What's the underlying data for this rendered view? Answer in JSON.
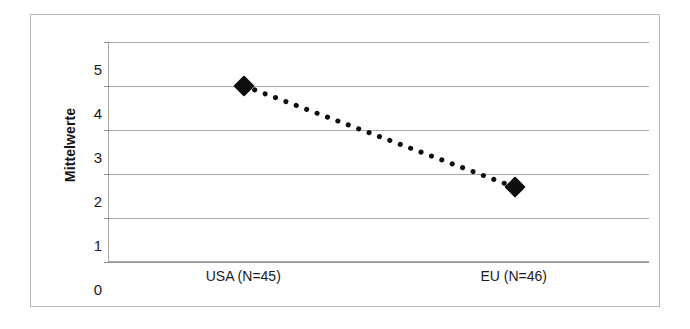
{
  "chart_data": {
    "type": "line",
    "title": "",
    "subtitle": "",
    "xlabel": "",
    "ylabel": "Mittelwerte",
    "categories": [
      "USA (N=45)",
      "EU (N=46)"
    ],
    "values": [
      4.0,
      1.7
    ],
    "series": [
      {
        "name": "Mittelwerte",
        "values": [
          4.0,
          1.7
        ],
        "marker": "diamond",
        "marker_color": "#0d0d0d",
        "line_style": "dotted",
        "line_color": "#0d0d0d"
      }
    ],
    "ylim": [
      0,
      5
    ],
    "ytick_labels": [
      "0",
      "1",
      "2",
      "3",
      "4",
      "5"
    ],
    "ytick_values": [
      0,
      1,
      2,
      3,
      4,
      5
    ],
    "grid": "horizontal",
    "legend": "none",
    "annotations": []
  },
  "axes": {
    "y_title": "Mittelwerte",
    "y_ticks": [
      "5",
      "4",
      "3",
      "2",
      "1",
      "0"
    ],
    "x_ticks": [
      "USA (N=45)",
      "EU (N=46)"
    ]
  },
  "colors": {
    "background": "#ffffff",
    "frame": "#b9b9b9",
    "gridline": "#a8a8a8",
    "axis": "#a6a6a6",
    "marker": "#0d0d0d",
    "text": "#1a1a1a"
  }
}
